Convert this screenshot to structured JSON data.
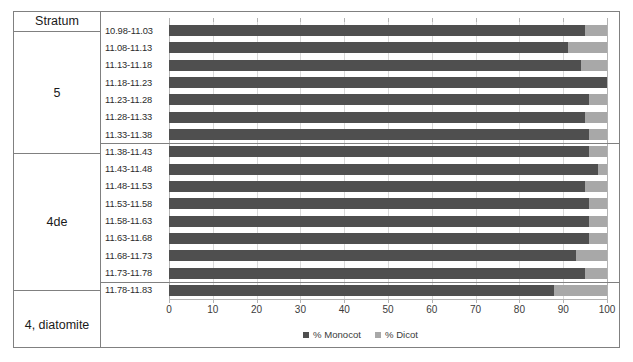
{
  "table": {
    "header_label": "Stratum",
    "groups": [
      {
        "name": "5",
        "rows": 7
      },
      {
        "name": "4de",
        "rows": 8
      },
      {
        "name": "4, diatomite",
        "rows": 1
      }
    ]
  },
  "legend": {
    "position": "bottom-center",
    "items": [
      {
        "label": "% Monocot",
        "color": "#4f4f4f",
        "swatch": "square-icon"
      },
      {
        "label": "% Dicot",
        "color": "#a8a8a8",
        "swatch": "square-icon"
      }
    ]
  },
  "axis": {
    "ticks": [
      "0",
      "10",
      "20",
      "30",
      "40",
      "50",
      "60",
      "70",
      "80",
      "90",
      "100"
    ]
  },
  "chart_data": {
    "type": "bar",
    "orientation": "horizontal",
    "stacked": true,
    "title": "",
    "xlabel": "",
    "ylabel": "",
    "xlim": [
      0,
      100
    ],
    "grid": true,
    "legend_position": "bottom-center",
    "categories": [
      "10.98-11.03",
      "11.08-11.13",
      "11.13-11.18",
      "11.18-11.23",
      "11.23-11.28",
      "11.28-11.33",
      "11.33-11.38",
      "11.38-11.43",
      "11.43-11.48",
      "11.48-11.53",
      "11.53-11.58",
      "11.58-11.63",
      "11.63-11.68",
      "11.68-11.73",
      "11.73-11.78",
      "11.78-11.83"
    ],
    "category_groups": [
      {
        "name": "5",
        "categories": [
          "10.98-11.03",
          "11.08-11.13",
          "11.13-11.18",
          "11.18-11.23",
          "11.23-11.28",
          "11.28-11.33",
          "11.33-11.38"
        ]
      },
      {
        "name": "4de",
        "categories": [
          "11.38-11.43",
          "11.43-11.48",
          "11.48-11.53",
          "11.53-11.58",
          "11.58-11.63",
          "11.63-11.68",
          "11.68-11.73",
          "11.73-11.78"
        ]
      },
      {
        "name": "4, diatomite",
        "categories": [
          "11.78-11.83"
        ]
      }
    ],
    "series": [
      {
        "name": "% Monocot",
        "color": "#4f4f4f",
        "values": [
          95,
          91,
          94,
          100,
          96,
          95,
          96,
          96,
          98,
          95,
          96,
          96,
          96,
          93,
          95,
          88
        ]
      },
      {
        "name": "% Dicot",
        "color": "#a8a8a8",
        "values": [
          5,
          9,
          6,
          0,
          4,
          5,
          4,
          4,
          2,
          5,
          4,
          4,
          4,
          7,
          5,
          12
        ]
      }
    ],
    "xticks": [
      0,
      10,
      20,
      30,
      40,
      50,
      60,
      70,
      80,
      90,
      100
    ]
  },
  "colors": {
    "monocot": "#4f4f4f",
    "dicot": "#a8a8a8",
    "border": "#808080",
    "gridline": "#d9d9d9"
  }
}
